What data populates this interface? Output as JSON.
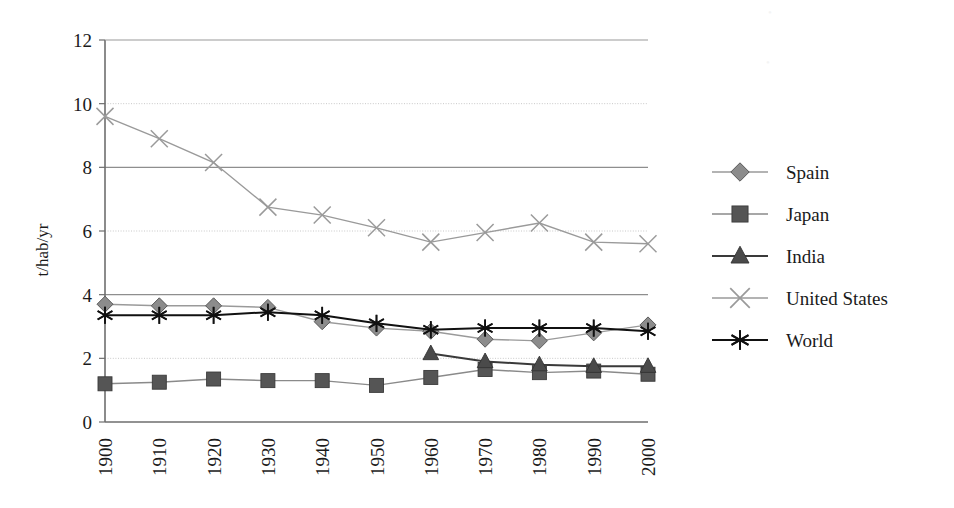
{
  "chart_data": {
    "type": "line",
    "title": "",
    "xlabel": "",
    "ylabel": "t/hab/yr",
    "x": [
      1900,
      1910,
      1920,
      1930,
      1940,
      1950,
      1960,
      1970,
      1980,
      1990,
      2000
    ],
    "categories": [
      "1900",
      "1910",
      "1920",
      "1930",
      "1940",
      "1950",
      "1960",
      "1970",
      "1980",
      "1990",
      "2000"
    ],
    "xlim": [
      1900,
      2000
    ],
    "ylim": [
      0,
      12
    ],
    "yticks": [
      "0",
      "2",
      "4",
      "6",
      "8",
      "10",
      "12"
    ],
    "ytick_values": [
      0,
      2,
      4,
      6,
      8,
      10,
      12
    ],
    "grid": "horizontal",
    "legend_position": "right",
    "series": [
      {
        "name": "Spain",
        "marker": "diamond",
        "color": "#8c8c8c",
        "line_color": "#9a9a9a",
        "values": [
          3.7,
          3.65,
          3.65,
          3.6,
          3.15,
          2.95,
          2.85,
          2.6,
          2.55,
          2.8,
          3.05
        ]
      },
      {
        "name": "Japan",
        "marker": "square",
        "color": "#555555",
        "line_color": "#8a8a8a",
        "values": [
          1.2,
          1.25,
          1.35,
          1.3,
          1.3,
          1.15,
          1.4,
          1.65,
          1.55,
          1.6,
          1.5
        ]
      },
      {
        "name": "India",
        "marker": "triangle",
        "color": "#4a4a4a",
        "line_color": "#3a3a3a",
        "values": [
          null,
          null,
          null,
          null,
          null,
          null,
          2.15,
          1.9,
          1.8,
          1.75,
          1.75
        ]
      },
      {
        "name": "United States",
        "marker": "x",
        "color": "#9a9a9a",
        "line_color": "#9a9a9a",
        "values": [
          9.6,
          8.9,
          8.15,
          6.75,
          6.5,
          6.1,
          5.65,
          5.95,
          6.25,
          5.65,
          5.6
        ]
      },
      {
        "name": "World",
        "marker": "asterisk",
        "color": "#111111",
        "line_color": "#111111",
        "values": [
          3.35,
          3.35,
          3.35,
          3.45,
          3.35,
          3.1,
          2.9,
          2.95,
          2.95,
          2.95,
          2.85
        ]
      }
    ]
  },
  "axes": {
    "y_title": "t/hab/yr"
  },
  "legend": {
    "items": [
      {
        "label": "Spain"
      },
      {
        "label": "Japan"
      },
      {
        "label": "India"
      },
      {
        "label": "United States"
      },
      {
        "label": "World"
      }
    ]
  },
  "colors": {
    "axis": "#6e6e6e",
    "grid_major": "#8e8e8e",
    "grid_minor": "#c8c8c8",
    "text": "#1a1a1a",
    "background": "#ffffff"
  }
}
